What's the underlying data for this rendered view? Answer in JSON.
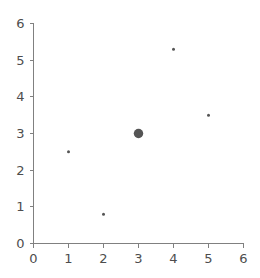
{
  "chart_data": {
    "type": "scatter",
    "title": "",
    "subtitle": "",
    "xlabel": "",
    "ylabel": "",
    "xlim": [
      0,
      6
    ],
    "ylim": [
      0,
      6
    ],
    "grid": false,
    "legend": false,
    "legend_position": "none",
    "marker_color": "#555555",
    "axis_color": "#808080",
    "tick_label_color": "#4d4d4d",
    "background_color": "#ffffff",
    "xticks": [
      0,
      1,
      2,
      3,
      4,
      5,
      6
    ],
    "yticks": [
      0,
      1,
      2,
      3,
      4,
      5,
      6
    ],
    "xtick_labels": [
      "0",
      "1",
      "2",
      "3",
      "4",
      "5",
      "6"
    ],
    "ytick_labels": [
      "0",
      "1",
      "2",
      "3",
      "4",
      "5",
      "6"
    ],
    "points": [
      {
        "x": 1,
        "y": 2.5,
        "size": 3.0,
        "label": "point-1"
      },
      {
        "x": 2,
        "y": 0.8,
        "size": 3.0,
        "label": "point-2"
      },
      {
        "x": 3,
        "y": 3.0,
        "size": 9.5,
        "label": "point-3-highlighted"
      },
      {
        "x": 4,
        "y": 5.3,
        "size": 3.0,
        "label": "point-4"
      },
      {
        "x": 5,
        "y": 3.5,
        "size": 3.0,
        "label": "point-5"
      }
    ]
  }
}
